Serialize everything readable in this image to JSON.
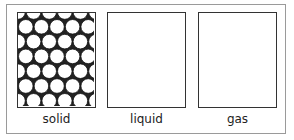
{
  "diagram": {
    "title": "",
    "panels": [
      {
        "id": "solid",
        "label": "solid",
        "particles": "close-packed-circles"
      },
      {
        "id": "liquid",
        "label": "liquid",
        "particles": "empty"
      },
      {
        "id": "gas",
        "label": "gas",
        "particles": "empty"
      }
    ]
  },
  "colors": {
    "border": "#333333",
    "frame": "#9a9a9a",
    "particle_fill": "#ffffff",
    "particle_gap": "#222222"
  }
}
